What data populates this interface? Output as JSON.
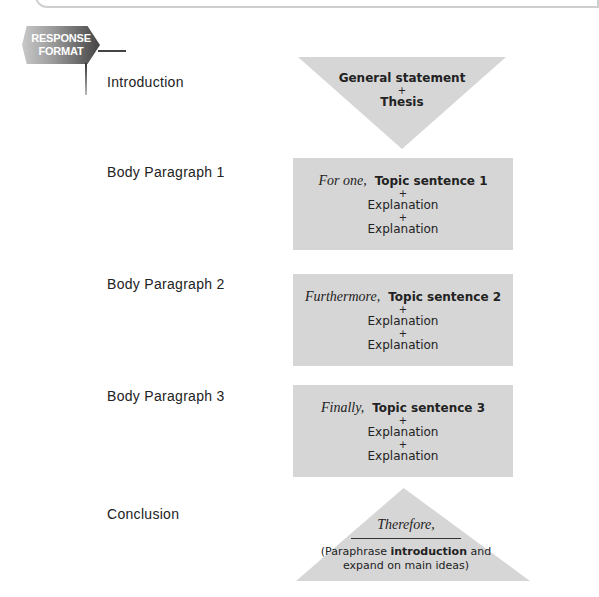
{
  "badge": {
    "line1": "RESPONSE",
    "line2": "FORMAT"
  },
  "sections": [
    {
      "label": "Introduction",
      "shape": "down-triangle",
      "lines": [
        "General statement",
        "+",
        "Thesis"
      ]
    },
    {
      "label": "Body Paragraph 1",
      "shape": "box",
      "transition": "For one,",
      "topic": "Topic sentence 1",
      "plus1": "+",
      "exp1": "Explanation",
      "plus2": "+",
      "exp2": "Explanation"
    },
    {
      "label": "Body Paragraph 2",
      "shape": "box",
      "transition": "Furthermore,",
      "topic": "Topic sentence 2",
      "plus1": "+",
      "exp1": "Explanation",
      "plus2": "+",
      "exp2": "Explanation"
    },
    {
      "label": "Body Paragraph 3",
      "shape": "box",
      "transition": "Finally,",
      "topic": "Topic sentence 3",
      "plus1": "+",
      "exp1": "Explanation",
      "plus2": "+",
      "exp2": "Explanation"
    },
    {
      "label": "Conclusion",
      "shape": "up-triangle",
      "transition": "Therefore,",
      "para_pre": "(Paraphrase ",
      "para_bold": "introduction",
      "para_post": " and",
      "para_line2": "expand on main ideas)"
    }
  ],
  "colors": {
    "shape_fill": "#d6d6d6",
    "text": "#222222"
  }
}
